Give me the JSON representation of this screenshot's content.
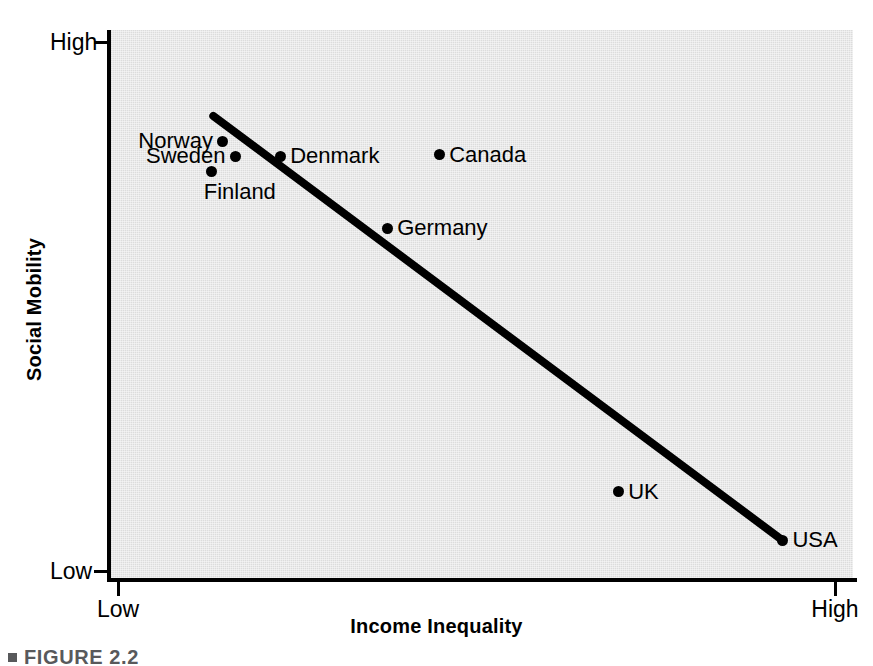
{
  "figure": {
    "caption": "FIGURE 2.2",
    "caption_bullet_icon": "square-bullet-icon"
  },
  "chart_data": {
    "type": "scatter",
    "title": "",
    "subtitle": "",
    "xlabel": "Income Inequality",
    "ylabel": "Social Mobility",
    "xticklabels": [
      "Low",
      "High"
    ],
    "yticklabels": [
      "Low",
      "High"
    ],
    "xlim": [
      "Low",
      "High"
    ],
    "ylim": [
      "Low",
      "High"
    ],
    "grid": false,
    "legend": "none",
    "plot_background_color": "#dcdcdc",
    "marker_color": "#000000",
    "trendline_color": "#000000",
    "points": [
      {
        "label": "Norway",
        "x": 0.152,
        "y": 0.797,
        "label_side": "left"
      },
      {
        "label": "Sweden",
        "x": 0.169,
        "y": 0.77,
        "label_side": "left"
      },
      {
        "label": "Finland",
        "x": 0.137,
        "y": 0.741,
        "label_side": "below"
      },
      {
        "label": "Denmark",
        "x": 0.229,
        "y": 0.77,
        "label_side": "right"
      },
      {
        "label": "Canada",
        "x": 0.443,
        "y": 0.772,
        "label_side": "right"
      },
      {
        "label": "Germany",
        "x": 0.373,
        "y": 0.638,
        "label_side": "right"
      },
      {
        "label": "UK",
        "x": 0.684,
        "y": 0.157,
        "label_side": "right"
      },
      {
        "label": "USA",
        "x": 0.905,
        "y": 0.069,
        "label_side": "right"
      }
    ],
    "trendline": {
      "description": "negative linear trend from upper-left to lower-right",
      "x_start": 0.139,
      "y_start": 0.843,
      "x_end": 0.905,
      "y_end": 0.069
    },
    "annotation": "Countries with higher income inequality tend to have lower social mobility"
  }
}
